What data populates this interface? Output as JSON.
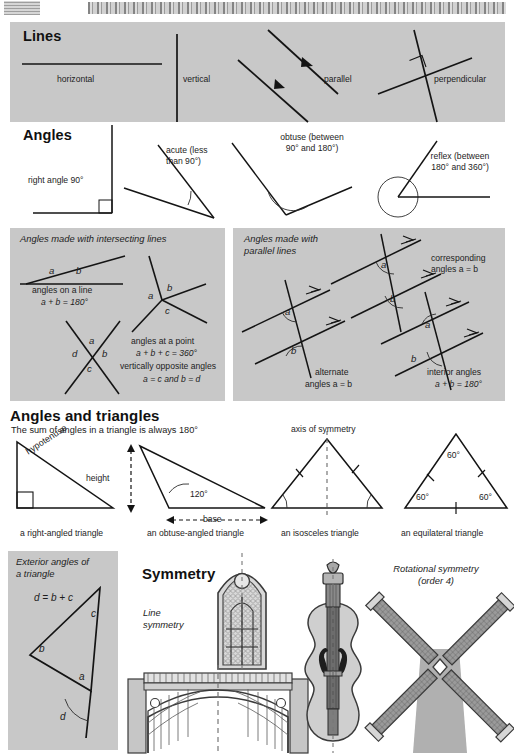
{
  "page": {
    "background": "#ffffff",
    "panel_color": "#c8c8c8"
  },
  "sections": {
    "lines": {
      "heading": "Lines",
      "items": [
        {
          "key": "horizontal",
          "label": "horizontal"
        },
        {
          "key": "vertical",
          "label": "vertical"
        },
        {
          "key": "parallel",
          "label": "parallel"
        },
        {
          "key": "perpendicular",
          "label": "perpendicular"
        }
      ]
    },
    "angles": {
      "heading": "Angles",
      "items": [
        {
          "key": "right",
          "label": "right angle 90°"
        },
        {
          "key": "acute",
          "line1": "acute (less",
          "line2": "than 90°)"
        },
        {
          "key": "obtuse",
          "line1": "obtuse (between",
          "line2": "90° and 180°)"
        },
        {
          "key": "reflex",
          "line1": "reflex (between",
          "line2": "180° and 360°)"
        }
      ]
    },
    "intersecting": {
      "heading_line1": "Angles made with intersecting lines",
      "figures": [
        {
          "key": "angles-on-a-line",
          "marks": [
            "a",
            "b"
          ],
          "caption1": "angles on a line",
          "caption2": "a + b = 180°"
        },
        {
          "key": "angles-at-a-point",
          "marks": [
            "a",
            "b",
            "c"
          ],
          "caption1": "angles at a point",
          "caption2": "a + b + c = 360°"
        },
        {
          "key": "vertically-opposite",
          "marks": [
            "a",
            "b",
            "c",
            "d"
          ],
          "caption1": "vertically opposite angles",
          "caption2": "a = c and b = d"
        }
      ]
    },
    "parallel_lines": {
      "heading_line1": "Angles made with",
      "heading_line2": "parallel lines",
      "figures": [
        {
          "key": "corresponding",
          "marks": [
            "a",
            "b"
          ],
          "caption1": "corresponding",
          "caption2": "angles a = b"
        },
        {
          "key": "alternate",
          "marks": [
            "a",
            "b"
          ],
          "caption1": "alternate",
          "caption2": "angles a = b"
        },
        {
          "key": "interior",
          "marks": [
            "a",
            "b"
          ],
          "caption1": "interior angles",
          "caption2": "a + b = 180°"
        }
      ]
    },
    "triangles": {
      "heading": "Angles and triangles",
      "subheading": "The sum of angles in a triangle is always 180°",
      "figures": [
        {
          "key": "right-angled",
          "caption": "a right-angled triangle",
          "annotations": [
            "hypotenuse"
          ]
        },
        {
          "key": "obtuse-angled",
          "caption": "an obtuse-angled triangle",
          "annotations": [
            "height",
            "base",
            "120°"
          ]
        },
        {
          "key": "isosceles",
          "caption": "an isosceles triangle",
          "annotations": [
            "axis of symmetry"
          ]
        },
        {
          "key": "equilateral",
          "caption": "an equilateral triangle",
          "annotations": [
            "60°",
            "60°",
            "60°"
          ]
        }
      ]
    },
    "exterior_angles": {
      "heading_line1": "Exterior angles of",
      "heading_line2": "a triangle",
      "formula": "d = b + c",
      "marks": [
        "a",
        "b",
        "c",
        "d"
      ]
    },
    "symmetry": {
      "heading": "Symmetry",
      "line_symmetry_line1": "Line",
      "line_symmetry_line2": "symmetry",
      "rotational_line1": "Rotational symmetry",
      "rotational_line2": "(order 4)",
      "figures": [
        {
          "key": "gothic-window",
          "name": "gothic-window-figure"
        },
        {
          "key": "stone-bridge",
          "name": "stone-bridge-figure"
        },
        {
          "key": "violin",
          "name": "violin-figure"
        },
        {
          "key": "windmill",
          "name": "windmill-figure"
        }
      ]
    }
  }
}
